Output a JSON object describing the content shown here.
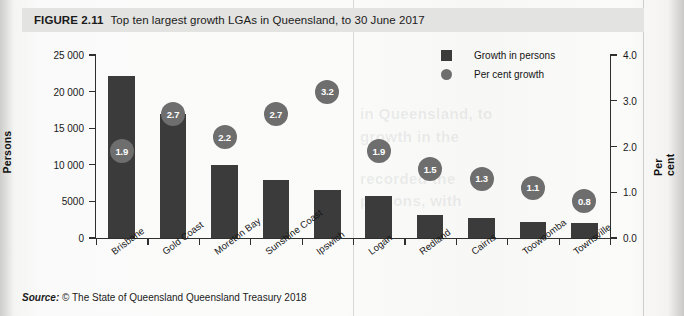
{
  "figure": {
    "number_label": "FIGURE 2.11",
    "title": "Top ten largest growth LGAs in Queensland, to 30 June 2017"
  },
  "source": {
    "label": "Source:",
    "text": "© The State of Queensland Queensland Treasury 2018"
  },
  "legend": {
    "items": [
      {
        "label": "Growth in persons",
        "marker": "square",
        "color": "#3b3b3b"
      },
      {
        "label": "Per cent growth",
        "marker": "circle",
        "color": "#6e6e6e"
      }
    ]
  },
  "chart_data": {
    "type": "bar",
    "title": "Top ten largest growth LGAs in Queensland, to 30 June 2017",
    "xlabel": "",
    "ylabel": "Persons",
    "y2label": "Per cent",
    "ylim": [
      0,
      25000
    ],
    "y2lim": [
      0.0,
      4.0
    ],
    "yticks": [
      "0",
      "5000",
      "10 000",
      "15 000",
      "20 000",
      "25 000"
    ],
    "ytick_values": [
      0,
      5000,
      10000,
      15000,
      20000,
      25000
    ],
    "y2ticks": [
      "0.0",
      "1.0",
      "2.0",
      "3.0",
      "4.0"
    ],
    "y2tick_values": [
      0.0,
      1.0,
      2.0,
      3.0,
      4.0
    ],
    "grid": false,
    "legend_position": "top-right",
    "categories": [
      "Brisbane",
      "Gold Coast",
      "Moreton Bay",
      "Sunshine Coast",
      "Ipswich",
      "Logan",
      "Redland",
      "Cairns",
      "Toowoomba",
      "Townsville"
    ],
    "series": [
      {
        "name": "Growth in persons",
        "type": "bar",
        "axis": "left",
        "color": "#3b3b3b",
        "values": [
          22100,
          17000,
          10000,
          7900,
          6500,
          5700,
          3100,
          2800,
          2200,
          2000
        ]
      },
      {
        "name": "Per cent growth",
        "type": "bubble",
        "axis": "right",
        "color": "#6e6e6e",
        "values": [
          1.9,
          2.7,
          2.2,
          2.7,
          3.2,
          1.9,
          1.5,
          1.3,
          1.1,
          0.8
        ],
        "labels": [
          "1.9",
          "2.7",
          "2.2",
          "2.7",
          "3.2",
          "1.9",
          "1.5",
          "1.3",
          "1.1",
          "0.8"
        ]
      }
    ]
  }
}
